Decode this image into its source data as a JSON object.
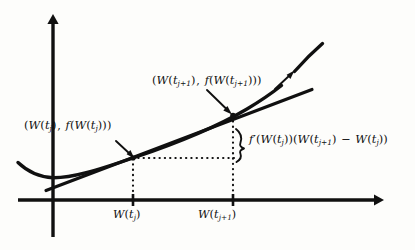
{
  "figure": {
    "background_color": "#fdfdfb",
    "ink_color": "#101010"
  },
  "axes": {
    "x_axis_name": "horizontal-axis",
    "y_axis_name": "vertical-axis",
    "x_axis": {
      "x_start": 18,
      "x_end": 381,
      "y": 200
    },
    "y_axis": {
      "x": 53,
      "y_start": 18,
      "y_end": 237
    },
    "origin": {
      "x": 53,
      "y": 200
    },
    "ticks": [
      {
        "name": "tick-w-tj",
        "x": 133,
        "label_html": "<span class=\"it\">W</span><span class=\"paren\">(</span><span class=\"it\">t</span><span class=\"sub\">j</span><span class=\"paren\">)</span>"
      },
      {
        "name": "tick-w-tj1",
        "x": 233,
        "label_html": "<span class=\"it\">W</span><span class=\"paren\">(</span><span class=\"it\">t</span><span class=\"sub\">j+1</span><span class=\"paren\">)</span>"
      }
    ]
  },
  "labels": {
    "point_tj": {
      "text": "(W(t_j), f(W(t_j)))",
      "html": "<span class=\"paren\">(</span><span class=\"it\">W</span><span class=\"paren\">(</span><span class=\"it\">t</span><span class=\"sub\">j</span><span class=\"paren\">)</span><span class=\"op\">,</span> <span class=\"it\">f</span><span class=\"paren\">(</span><span class=\"it\">W</span><span class=\"paren\">(</span><span class=\"it\">t</span><span class=\"sub\">j</span><span class=\"paren\">)))</span>"
    },
    "point_tj1": {
      "text": "(W(t_{j+1}), f(W(t_{j+1})))",
      "html": "<span class=\"paren\">(</span><span class=\"it\">W</span><span class=\"paren\">(</span><span class=\"it\">t</span><span class=\"sub\">j+1</span><span class=\"paren\">)</span><span class=\"op\">,</span> <span class=\"it\">f</span><span class=\"paren\">(</span><span class=\"it\">W</span><span class=\"paren\">(</span><span class=\"it\">t</span><span class=\"sub\">j+1</span><span class=\"paren\">)))</span>"
    },
    "increment": {
      "text": "f'(W(t_j))(W(t_{j+1}) - W(t_j))",
      "html": "<span class=\"it\">f</span><span class=\"prime\">&prime;</span><span class=\"paren\">(</span><span class=\"it\">W</span><span class=\"paren\">(</span><span class=\"it\">t</span><span class=\"sub\">j</span><span class=\"paren\">))(</span><span class=\"it\">W</span><span class=\"paren\">(</span><span class=\"it\">t</span><span class=\"sub\">j+1</span><span class=\"paren\">)</span> <span class=\"op\">&minus;</span> <span class=\"it\">W</span><span class=\"paren\">(</span><span class=\"it\">t</span><span class=\"sub\">j</span><span class=\"paren\">))</span>"
    },
    "tick_tj": {
      "text": "W(t_j)",
      "html": "<span class=\"it\">W</span><span class=\"paren\">(</span><span class=\"it\">t</span><span class=\"sub\">j</span><span class=\"paren\">)</span>"
    },
    "tick_tj1": {
      "text": "W(t_{j+1})",
      "html": "<span class=\"it\">W</span><span class=\"paren\">(</span><span class=\"it\">t</span><span class=\"sub\">j+1</span><span class=\"paren\">)</span>"
    }
  },
  "chart_data": {
    "type": "line",
    "xlabel": "",
    "ylabel": "",
    "grid": false,
    "legend": null,
    "axis_origin_px": {
      "x": 53,
      "y": 200
    },
    "series": [
      {
        "name": "function-curve",
        "role": "convex curve f(W)",
        "style": "solid-thick",
        "points_px": [
          [
            18,
            163
          ],
          [
            26,
            170
          ],
          [
            36,
            175
          ],
          [
            47,
            177.5
          ],
          [
            58,
            177.5
          ],
          [
            72,
            175.5
          ],
          [
            90,
            171
          ],
          [
            110,
            165
          ],
          [
            133,
            158
          ],
          [
            160,
            148
          ],
          [
            185,
            136
          ],
          [
            210,
            125
          ],
          [
            233,
            115
          ],
          [
            252,
            105
          ],
          [
            268,
            95
          ],
          [
            281,
            86
          ]
        ],
        "gap_px": [
          [
            281,
            86
          ],
          [
            295,
            72
          ]
        ],
        "points_px_resume": [
          [
            295,
            72
          ],
          [
            305,
            62
          ],
          [
            315,
            52
          ],
          [
            322,
            45
          ]
        ]
      },
      {
        "name": "tangent-line",
        "role": "tangent at (W(t_j), f(W(t_j)))",
        "style": "solid-thick",
        "points_px": [
          [
            47,
            190
          ],
          [
            133,
            158
          ],
          [
            233,
            120
          ],
          [
            312,
            90
          ]
        ],
        "slope_per_px": -0.3787
      }
    ],
    "marked_points": [
      {
        "name": "point-at-tj",
        "x_px": 133,
        "y_px": 158,
        "x_value_label": "W(t_j)",
        "y_value_label": "f(W(t_j))"
      },
      {
        "name": "point-at-tj1",
        "x_px": 233,
        "y_px": 115,
        "x_value_label": "W(t_{j+1})",
        "y_value_label": "f(W(t_{j+1}))"
      }
    ],
    "guide_lines": [
      {
        "name": "horizontal-dotted-guide",
        "from_px": [
          133,
          158
        ],
        "to_px": [
          233,
          158
        ],
        "style": "dotted"
      },
      {
        "name": "vertical-dotted-guide-tj",
        "from_px": [
          133,
          158
        ],
        "to_px": [
          133,
          200
        ],
        "style": "dotted"
      },
      {
        "name": "vertical-dotted-guide-tj1",
        "from_px": [
          233,
          115
        ],
        "to_px": [
          233,
          200
        ],
        "style": "dotted"
      }
    ],
    "annotations": [
      {
        "name": "brace-increment",
        "type": "curly-brace",
        "span_px": [
          [
            238,
            132
          ],
          [
            238,
            155
          ]
        ],
        "labels_to": "increment"
      },
      {
        "name": "arrow-to-point-tj",
        "type": "arrow",
        "from_px": [
          118,
          143
        ],
        "to_px": [
          134,
          157
        ]
      },
      {
        "name": "arrow-to-point-tj1",
        "type": "arrow",
        "from_px": [
          209,
          92
        ],
        "to_px": [
          231,
          113
        ]
      },
      {
        "name": "arrow-to-curve-top",
        "type": "arrow",
        "from_px": [
          276,
          88
        ],
        "to_px": [
          294,
          71
        ]
      }
    ]
  }
}
